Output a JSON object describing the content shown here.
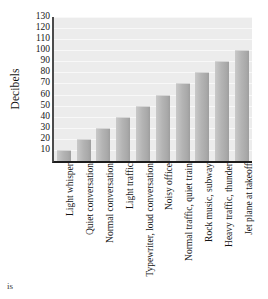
{
  "chart_data": {
    "type": "bar",
    "title": "",
    "xlabel": "",
    "ylabel": "Decibels",
    "categories": [
      "Light whisper",
      "Quiet conversation",
      "Normal conversation",
      "Light traffic",
      "Typewriter, loud conversation",
      "Noisy office",
      "Normal traffic, quiet train",
      "Rock music, subway",
      "Heavy traffic, thunder",
      "Jet plane at takeoff"
    ],
    "values": [
      10,
      20,
      30,
      40,
      50,
      60,
      70,
      80,
      90,
      100
    ],
    "ylim": [
      0,
      130
    ],
    "yticks": [
      10,
      20,
      30,
      40,
      50,
      60,
      70,
      80,
      90,
      100,
      110,
      120,
      130
    ],
    "ytick_labels": [
      "10",
      "20",
      "30",
      "40",
      "50",
      "60",
      "70",
      "80",
      "90",
      "100",
      "110",
      "120",
      "130"
    ],
    "grid": true,
    "legend": false,
    "legend_position": "none",
    "bar_color": "#b4b4b4",
    "plot_background": "#ececec",
    "axis_color": "#1d1d1d",
    "gridline_color": "#f8f8f8"
  },
  "page": {
    "fragment_text": "is"
  }
}
